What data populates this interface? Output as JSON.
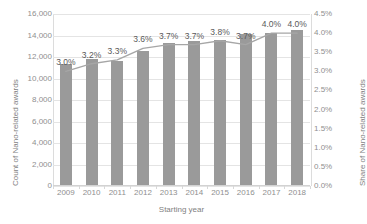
{
  "chart_data": {
    "type": "bar",
    "title": "",
    "xlabel": "Starting year",
    "categories": [
      "2009",
      "2010",
      "2011",
      "2012",
      "2013",
      "2014",
      "2015",
      "2016",
      "2017",
      "2018"
    ],
    "grid": true,
    "legend": "none",
    "series": [
      {
        "name": "Count of Nano-related awards",
        "type": "bar",
        "axis": "left",
        "color": "#9a9a9a",
        "values": [
          11350,
          11800,
          11650,
          12550,
          13350,
          13450,
          13600,
          14100,
          14250,
          14500
        ]
      },
      {
        "name": "Share of Nano-related awards",
        "type": "line",
        "axis": "right",
        "color": "#a6a6a6",
        "values": [
          3.0,
          3.2,
          3.3,
          3.6,
          3.7,
          3.7,
          3.8,
          3.7,
          4.0,
          4.0
        ],
        "data_labels": [
          "3.0%",
          "3.2%",
          "3.3%",
          "3.6%",
          "3.7%",
          "3.7%",
          "3.8%",
          "3.7%",
          "4.0%",
          "4.0%"
        ]
      }
    ],
    "left_axis": {
      "label": "Count of Nano-related awards",
      "min": 0,
      "max": 16000,
      "step": 2000,
      "ticks": [
        "0",
        "2,000",
        "4,000",
        "6,000",
        "8,000",
        "10,000",
        "12,000",
        "14,000",
        "16,000"
      ]
    },
    "right_axis": {
      "label": "Share of Nano-related awards",
      "min": 0,
      "max": 4.5,
      "step": 0.5,
      "ticks": [
        "0.0%",
        "0.5%",
        "1.0%",
        "1.5%",
        "2.0%",
        "2.5%",
        "3.0%",
        "3.5%",
        "4.0%",
        "4.5%"
      ]
    }
  }
}
